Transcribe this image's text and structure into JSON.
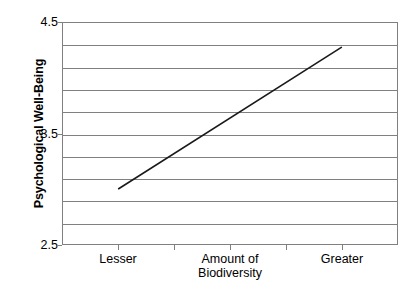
{
  "chart_data": {
    "type": "line",
    "title": "",
    "xlabel": "Amount of Biodiversity",
    "ylabel": "Psychological Well-Being",
    "categories": [
      "Lesser",
      "Greater"
    ],
    "x": [
      1,
      5
    ],
    "values": [
      3.0,
      4.28
    ],
    "series": [
      {
        "name": "Psychological Well-Being",
        "values": [
          3.0,
          4.28
        ],
        "color": "#1a1a1a"
      }
    ],
    "ylim": [
      2.5,
      4.5
    ],
    "ytick_labels": [
      "4.5",
      "3.5",
      "2.5"
    ],
    "ytick_values": [
      4.5,
      3.5,
      2.5
    ],
    "gridline_values": [
      4.5,
      4.3,
      4.1,
      3.9,
      3.7,
      3.5,
      3.3,
      3.1,
      2.9,
      2.7,
      2.5
    ],
    "grid": true,
    "legend": "none",
    "legend_position": "none",
    "xtick_values": [
      1,
      2,
      3,
      4,
      5
    ],
    "annotations": []
  },
  "axes": {
    "y_title": "Psychological Well-Being",
    "y_tick_labels": [
      {
        "text": "4.5",
        "value": 4.5
      },
      {
        "text": "3.5",
        "value": 3.5
      },
      {
        "text": "2.5",
        "value": 2.5
      }
    ],
    "x_title_line1": "Amount of",
    "x_title_line2": "Biodiversity",
    "x_category_left": "Lesser",
    "x_category_right": "Greater"
  },
  "colors": {
    "axis": "#808080",
    "gridline": "#808080",
    "series_line": "#1a1a1a",
    "background": "#ffffff",
    "text": "#000000"
  },
  "page": {
    "bleed_text": ""
  }
}
